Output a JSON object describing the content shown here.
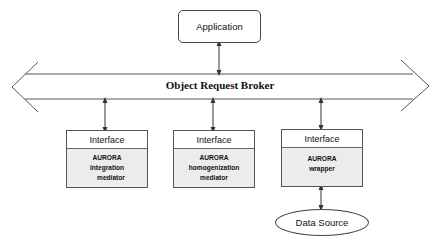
{
  "application": {
    "label": "Application"
  },
  "bus": {
    "label": "Object Request Broker"
  },
  "components": [
    {
      "header": "Interface",
      "lines": [
        "AURORA",
        "integration",
        "mediator"
      ]
    },
    {
      "header": "Interface",
      "lines": [
        "AURORA",
        "homogenization",
        "mediator"
      ]
    },
    {
      "header": "Interface",
      "lines": [
        "AURORA",
        "wrapper",
        ""
      ]
    }
  ],
  "data_source": {
    "label": "Data Source"
  },
  "colors": {
    "line": "#444444",
    "shade": "#ececec"
  }
}
